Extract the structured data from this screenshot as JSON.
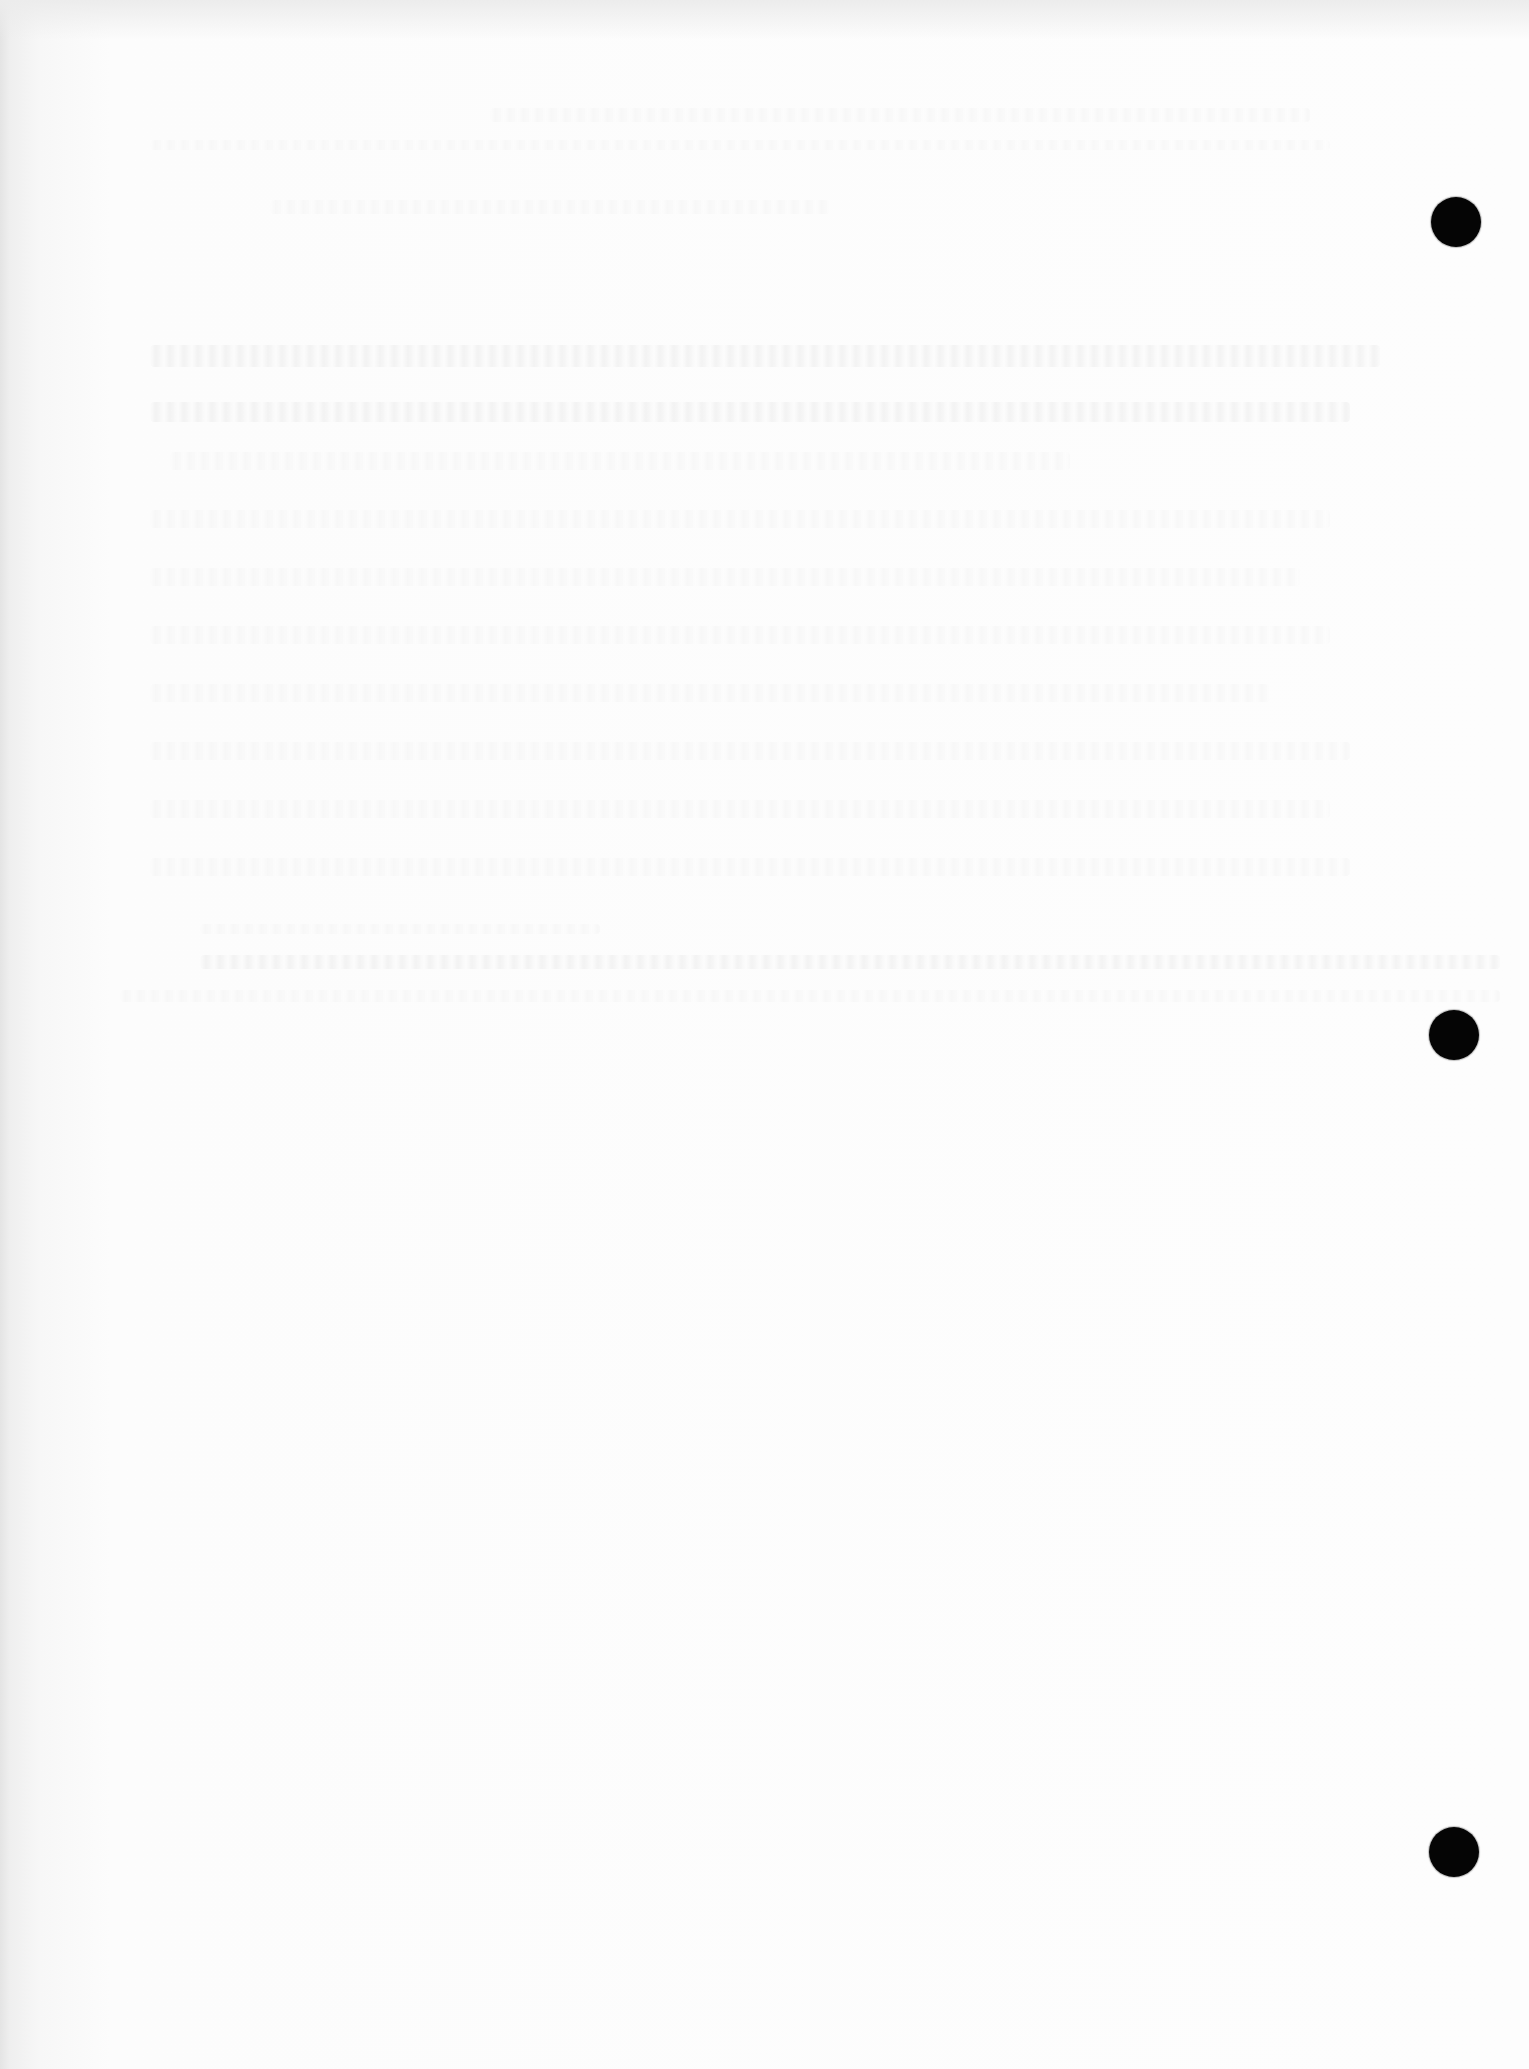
{
  "document": {
    "type": "scanned-blank-page",
    "legible_text": [],
    "punch_holes": [
      {
        "id": "top",
        "cx": 1456,
        "cy": 222,
        "r": 25
      },
      {
        "id": "middle",
        "cx": 1454,
        "cy": 1035,
        "r": 25
      },
      {
        "id": "bottom",
        "cx": 1454,
        "cy": 1852,
        "r": 25
      }
    ],
    "colors": {
      "paper": "#fbfbfb",
      "hole": "#050505",
      "left_edge_shadow": "#e4e4e4"
    }
  }
}
